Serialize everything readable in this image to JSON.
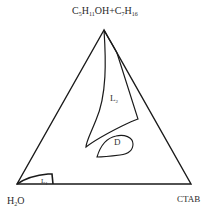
{
  "diagram": {
    "type": "ternary-phase-diagram",
    "vertices": {
      "top": {
        "formula_parts": [
          "C",
          "5",
          "H",
          "11",
          "OH+C",
          "7",
          "H",
          "16"
        ],
        "text": "C5H11OH+C7H16"
      },
      "bottom_left": {
        "formula_parts": [
          "H",
          "2",
          "O"
        ],
        "text": "H2O"
      },
      "bottom_right": {
        "text": "CTAB"
      }
    },
    "regions": [
      {
        "id": "L2",
        "label_main": "L",
        "label_sub": "2"
      },
      {
        "id": "D",
        "label_main": "D"
      },
      {
        "id": "L1",
        "label_main": "L",
        "label_sub": "1"
      }
    ],
    "line_color": "#1a1a1a",
    "background": "#ffffff"
  }
}
